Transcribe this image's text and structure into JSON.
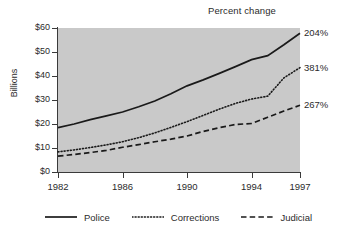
{
  "chart_data": {
    "type": "line",
    "title": "Percent change",
    "xlabel": "",
    "ylabel": "Billions",
    "x": [
      1982,
      1983,
      1984,
      1985,
      1986,
      1987,
      1988,
      1989,
      1990,
      1991,
      1992,
      1993,
      1994,
      1995,
      1996,
      1997
    ],
    "xtick_labels": [
      "1982",
      "1986",
      "1990",
      "1994",
      "1997"
    ],
    "xtick_values": [
      1982,
      1986,
      1990,
      1994,
      1997
    ],
    "xlim": [
      1982,
      1997
    ],
    "ytick_labels": [
      "$0",
      "$10",
      "$20",
      "$30",
      "$40",
      "$50",
      "$60"
    ],
    "ytick_values": [
      0,
      10,
      20,
      30,
      40,
      50,
      60
    ],
    "ylim": [
      0,
      60
    ],
    "grid": false,
    "legend_position": "bottom",
    "plot_background": "#c9c9c9",
    "series": [
      {
        "name": "Police",
        "style": "solid",
        "color": "#1a1a1a",
        "end_annotation": "204%",
        "values": [
          18.5,
          20.0,
          21.8,
          23.4,
          25.0,
          27.2,
          29.6,
          32.6,
          35.9,
          38.4,
          41.1,
          43.9,
          46.8,
          48.5,
          53.0,
          57.8
        ]
      },
      {
        "name": "Corrections",
        "style": "dotted",
        "color": "#1a1a1a",
        "end_annotation": "381%",
        "values": [
          8.4,
          9.2,
          10.2,
          11.3,
          12.6,
          14.3,
          16.3,
          18.6,
          21.0,
          23.6,
          26.2,
          28.6,
          30.4,
          31.6,
          39.2,
          43.5
        ]
      },
      {
        "name": "Judicial",
        "style": "dashed",
        "color": "#1a1a1a",
        "end_annotation": "267%",
        "values": [
          6.6,
          7.3,
          8.1,
          9.0,
          10.3,
          11.4,
          12.6,
          13.7,
          15.0,
          16.9,
          18.5,
          19.8,
          20.2,
          22.8,
          25.4,
          27.8
        ]
      }
    ],
    "annotations": [
      {
        "label": "204%",
        "series": "Police"
      },
      {
        "label": "381%",
        "series": "Corrections"
      },
      {
        "label": "267%",
        "series": "Judicial"
      }
    ]
  }
}
